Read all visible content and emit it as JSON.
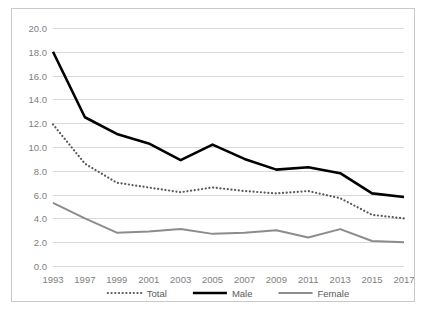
{
  "chart_data": {
    "type": "line",
    "title": "",
    "xlabel": "",
    "ylabel": "",
    "categories": [
      "1993",
      "1997",
      "1999",
      "2001",
      "2003",
      "2005",
      "2007",
      "2009",
      "2011",
      "2013",
      "2015",
      "2017"
    ],
    "ylim": [
      0.0,
      20.0
    ],
    "ytick_step": 2.0,
    "ytick_labels": [
      "0.0",
      "2.0",
      "4.0",
      "6.0",
      "8.0",
      "10.0",
      "12.0",
      "14.0",
      "16.0",
      "18.0",
      "20.0"
    ],
    "grid": "horizontal",
    "legend_position": "bottom-center",
    "series": [
      {
        "name": "Total",
        "style": "dotted",
        "color": "#595959",
        "values": [
          11.9,
          8.6,
          7.0,
          6.6,
          6.2,
          6.6,
          6.3,
          6.1,
          6.3,
          5.7,
          4.3,
          4.0
        ]
      },
      {
        "name": "Male",
        "style": "solid-thick",
        "color": "#000000",
        "values": [
          18.0,
          12.5,
          11.1,
          10.3,
          8.9,
          10.2,
          9.0,
          8.1,
          8.3,
          7.8,
          6.1,
          5.8
        ]
      },
      {
        "name": "Female",
        "style": "solid",
        "color": "#8c8c8c",
        "values": [
          5.3,
          4.0,
          2.8,
          2.9,
          3.1,
          2.7,
          2.8,
          3.0,
          2.4,
          3.1,
          2.1,
          2.0
        ]
      }
    ]
  },
  "frame": {
    "border_color": "#c9c9c9",
    "background": "#ffffff",
    "gridline_color": "#d9d9d9",
    "axis_label_color": "#808080",
    "legend_label_color": "#595959"
  }
}
